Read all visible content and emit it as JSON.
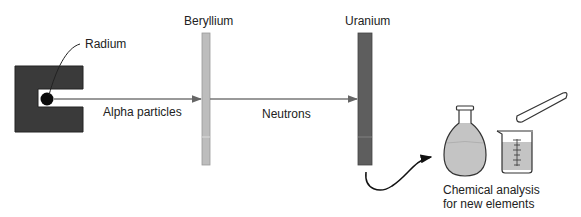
{
  "diagram": {
    "labels": {
      "radium": "Radium",
      "alpha": "Alpha particles",
      "beryllium": "Beryllium",
      "neutrons": "Neutrons",
      "uranium": "Uranium",
      "analysis_line1": "Chemical analysis",
      "analysis_line2": "for new elements"
    },
    "colors": {
      "source_block": "#3a3a3a",
      "beryllium": "#bdbdbd",
      "uranium": "#5e5e5e",
      "liquid": "#c4c4c4",
      "arrow": "#777777",
      "outline": "#333333"
    }
  }
}
